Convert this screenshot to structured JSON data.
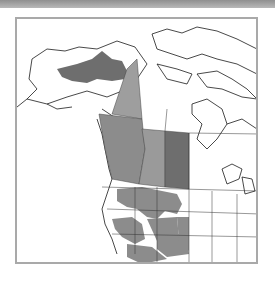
{
  "map": {
    "title": "Range map: western North America",
    "colors": {
      "dark_fill": "#6e6e6e",
      "medium_fill": "#8c8c8c",
      "light_fill": "#9e9e9e",
      "outline": "#1a1a1a",
      "frame": "#a9a9a9",
      "top_band": "#9a9a9a"
    },
    "shaded_regions": [
      "Alaska interior",
      "Yukon",
      "British Columbia",
      "Alberta",
      "Saskatchewan",
      "Montana",
      "Idaho",
      "Oregon",
      "Nevada",
      "Utah",
      "Wyoming",
      "Colorado",
      "Arizona",
      "New Mexico",
      "California"
    ]
  }
}
